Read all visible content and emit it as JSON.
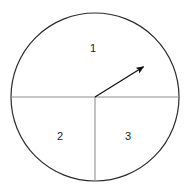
{
  "figure": {
    "name": "spinner-diagram",
    "type": "spinner-wheel",
    "width": 192,
    "height": 192,
    "background_color": "#ffffff"
  },
  "chart_data": {
    "type": "pie",
    "title": "",
    "xlabel": "",
    "ylabel": "",
    "legend": "none",
    "grid": false,
    "categories": [
      "1",
      "2",
      "3"
    ],
    "values": [
      50,
      25,
      25
    ],
    "unit": "percent",
    "note": "Circle split by a horizontal diameter and a lower vertical radius into a half (1) and two quarters (2, 3)."
  },
  "circle": {
    "center_x": 95,
    "center_y": 97,
    "radius": 84,
    "stroke_color": "#2b2b2b",
    "stroke_width": 1.2,
    "fill_color": "#ffffff"
  },
  "dividers": [
    {
      "name": "horizontal-diameter",
      "x1": 11,
      "y1": 97,
      "x2": 179,
      "y2": 97,
      "stroke_color": "#8f8f8f",
      "stroke_width": 1.1
    },
    {
      "name": "vertical-radius",
      "x1": 95,
      "y1": 97,
      "x2": 95,
      "y2": 181,
      "stroke_color": "#8f8f8f",
      "stroke_width": 1.1
    }
  ],
  "pointer": {
    "name": "spinner-arrow",
    "start_x": 95,
    "start_y": 97,
    "end_x": 148,
    "end_y": 64,
    "angle_degrees": 32,
    "stroke_color": "#111111",
    "stroke_width": 1.3,
    "head_color": "#111111",
    "points_to_sector": "1"
  },
  "labels": [
    {
      "text": "1",
      "x": 93,
      "y": 49,
      "sector": "upper-half"
    },
    {
      "text": "2",
      "x": 60,
      "y": 137,
      "sector": "lower-left-quarter"
    },
    {
      "text": "3",
      "x": 128,
      "y": 137,
      "sector": "lower-right-quarter"
    }
  ]
}
